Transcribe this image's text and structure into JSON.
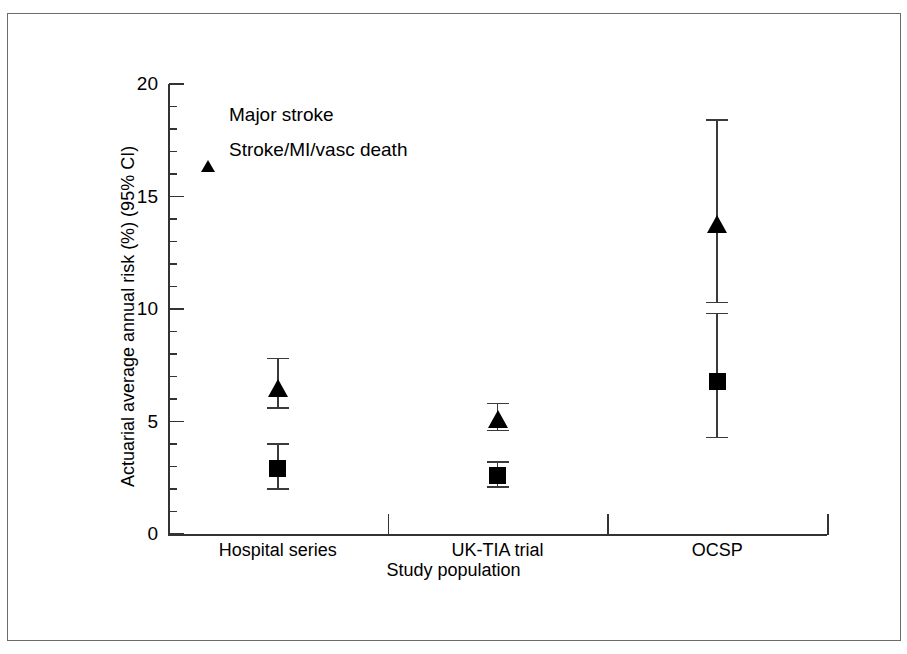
{
  "figure": {
    "background_color": "#ffffff",
    "border_color": "#6b6b6b",
    "marker_color": "#000000",
    "axis_color": "#333333"
  },
  "chart_data": {
    "type": "scatter",
    "title": "",
    "xlabel": "Study population",
    "ylabel": "Actuarial average annual risk (%) (95% CI)",
    "categories": [
      "Hospital series",
      "UK-TIA trial",
      "OCSP"
    ],
    "ylim": [
      0,
      20
    ],
    "yticks": [
      0,
      5,
      10,
      15,
      20
    ],
    "ytick_labels": [
      "0",
      "5",
      "10",
      "15",
      "20"
    ],
    "minor_tick_interval": 1,
    "grid": false,
    "legend_position": "upper left",
    "error_bars": "95% CI",
    "series": [
      {
        "name": "Major stroke",
        "marker": "square",
        "values": [
          2.9,
          2.6,
          6.8
        ],
        "ci_low": [
          2.0,
          2.1,
          4.3
        ],
        "ci_high": [
          4.0,
          3.2,
          9.8
        ]
      },
      {
        "name": "Stroke/MI/vasc death",
        "marker": "triangle",
        "values": [
          6.5,
          5.1,
          13.8
        ],
        "ci_low": [
          5.6,
          4.6,
          10.3
        ],
        "ci_high": [
          7.8,
          5.8,
          18.4
        ]
      }
    ]
  },
  "legend": {
    "items": [
      {
        "label": "Major stroke",
        "marker": "square-marker-icon"
      },
      {
        "label": "Stroke/MI/vasc death",
        "marker": "triangle-marker-icon"
      }
    ]
  }
}
